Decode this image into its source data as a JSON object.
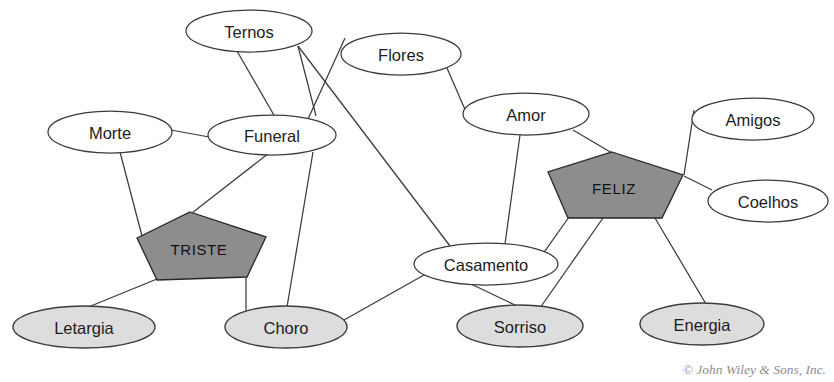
{
  "diagram": {
    "type": "semantic-network",
    "colors": {
      "background": "#ffffff",
      "edge": "#3b3b3b",
      "ellipse_fill": "#ffffff",
      "shaded_ellipse_fill": "#dddddd",
      "concept_fill": "#8d8d8d",
      "concept_stroke": "#262626",
      "label": "#1c1c1c",
      "credit": "#8e8e8e"
    },
    "nodes": [
      {
        "id": "ternos",
        "label": "Ternos",
        "shape": "ellipse",
        "style": "plain",
        "cx": 249,
        "cy": 31,
        "rx": 63,
        "ry": 21
      },
      {
        "id": "flores",
        "label": "Flores",
        "shape": "ellipse",
        "style": "plain",
        "cx": 401,
        "cy": 54,
        "rx": 60,
        "ry": 21
      },
      {
        "id": "morte",
        "label": "Morte",
        "shape": "ellipse",
        "style": "plain",
        "cx": 110,
        "cy": 132,
        "rx": 62,
        "ry": 21
      },
      {
        "id": "funeral",
        "label": "Funeral",
        "shape": "ellipse",
        "style": "plain",
        "cx": 272,
        "cy": 135,
        "rx": 64,
        "ry": 20
      },
      {
        "id": "amor",
        "label": "Amor",
        "shape": "ellipse",
        "style": "plain",
        "cx": 526,
        "cy": 114,
        "rx": 63,
        "ry": 21
      },
      {
        "id": "amigos",
        "label": "Amigos",
        "shape": "ellipse",
        "style": "plain",
        "cx": 753,
        "cy": 119,
        "rx": 61,
        "ry": 21
      },
      {
        "id": "coelhos",
        "label": "Coelhos",
        "shape": "ellipse",
        "style": "plain",
        "cx": 768,
        "cy": 201,
        "rx": 60,
        "ry": 21
      },
      {
        "id": "casamento",
        "label": "Casamento",
        "shape": "ellipse",
        "style": "plain",
        "cx": 486,
        "cy": 264,
        "rx": 72,
        "ry": 21
      },
      {
        "id": "letargia",
        "label": "Letargia",
        "shape": "ellipse",
        "style": "shaded",
        "cx": 84,
        "cy": 327,
        "rx": 71,
        "ry": 21
      },
      {
        "id": "choro",
        "label": "Choro",
        "shape": "ellipse",
        "style": "shaded",
        "cx": 286,
        "cy": 327,
        "rx": 61,
        "ry": 21
      },
      {
        "id": "sorriso",
        "label": "Sorriso",
        "shape": "ellipse",
        "style": "shaded",
        "cx": 520,
        "cy": 326,
        "rx": 63,
        "ry": 21
      },
      {
        "id": "energia",
        "label": "Energia",
        "shape": "ellipse",
        "style": "shaded",
        "cx": 702,
        "cy": 324,
        "rx": 62,
        "ry": 21
      },
      {
        "id": "triste",
        "label": "TRISTE",
        "shape": "pentagon",
        "style": "concept",
        "cx": 199,
        "cy": 248,
        "points": "190,212 266,237 247,277 157,280 137,238"
      },
      {
        "id": "feliz",
        "label": "FELIZ",
        "shape": "pentagon",
        "style": "concept",
        "cx": 614,
        "cy": 187,
        "points": "612,152 683,175 662,218 568,218 548,172"
      }
    ],
    "edges": [
      {
        "from": "ternos",
        "to": "funeral",
        "x1": 237,
        "y1": 51,
        "x2": 275,
        "y2": 117
      },
      {
        "from": "ternos",
        "to": "funeral",
        "x1": 298,
        "y1": 46,
        "x2": 316,
        "y2": 116
      },
      {
        "from": "flores",
        "to": "funeral",
        "x1": 345,
        "y1": 38,
        "x2": 298,
        "y2": 141
      },
      {
        "from": "ternos",
        "to": "casamento",
        "x1": 298,
        "y1": 46,
        "x2": 450,
        "y2": 246
      },
      {
        "from": "flores",
        "to": "amor",
        "x1": 447,
        "y1": 68,
        "x2": 470,
        "y2": 121
      },
      {
        "from": "morte",
        "to": "funeral",
        "x1": 171,
        "y1": 130,
        "x2": 209,
        "y2": 137
      },
      {
        "from": "morte",
        "to": "triste",
        "x1": 120,
        "y1": 152,
        "x2": 142,
        "y2": 236
      },
      {
        "from": "funeral",
        "to": "triste",
        "x1": 269,
        "y1": 153,
        "x2": 192,
        "y2": 213
      },
      {
        "from": "funeral",
        "to": "choro",
        "x1": 313,
        "y1": 152,
        "x2": 287,
        "y2": 307
      },
      {
        "from": "triste",
        "to": "letargia",
        "x1": 157,
        "y1": 279,
        "x2": 86,
        "y2": 308
      },
      {
        "from": "triste",
        "to": "choro",
        "x1": 246,
        "y1": 276,
        "x2": 246,
        "y2": 312
      },
      {
        "from": "choro",
        "to": "casamento",
        "x1": 344,
        "y1": 320,
        "x2": 424,
        "y2": 275
      },
      {
        "from": "amor",
        "to": "casamento",
        "x1": 520,
        "y1": 135,
        "x2": 505,
        "y2": 244
      },
      {
        "from": "amor",
        "to": "feliz",
        "x1": 573,
        "y1": 130,
        "x2": 612,
        "y2": 153
      },
      {
        "from": "amigos",
        "to": "feliz",
        "x1": 694,
        "y1": 110,
        "x2": 684,
        "y2": 175
      },
      {
        "from": "coelhos",
        "to": "feliz",
        "x1": 712,
        "y1": 190,
        "x2": 684,
        "y2": 176
      },
      {
        "from": "feliz",
        "to": "casamento",
        "x1": 569,
        "y1": 217,
        "x2": 540,
        "y2": 258
      },
      {
        "from": "feliz",
        "to": "sorriso",
        "x1": 603,
        "y1": 218,
        "x2": 540,
        "y2": 308
      },
      {
        "from": "feliz",
        "to": "energia",
        "x1": 655,
        "y1": 218,
        "x2": 706,
        "y2": 304
      },
      {
        "from": "casamento",
        "to": "sorriso",
        "x1": 471,
        "y1": 284,
        "x2": 517,
        "y2": 306
      }
    ],
    "credit": "© John Wiley & Sons, Inc."
  }
}
